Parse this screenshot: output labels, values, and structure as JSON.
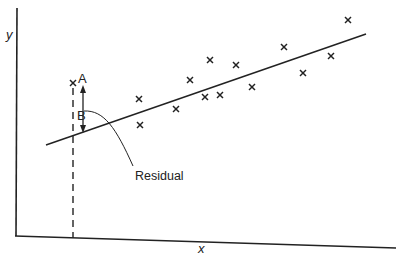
{
  "chart_data": {
    "type": "scatter",
    "title": "",
    "xlabel": "x",
    "ylabel": "y",
    "grid": false,
    "legend": null,
    "points_px": [
      [
        139,
        99
      ],
      [
        140,
        125
      ],
      [
        176,
        109
      ],
      [
        190,
        80
      ],
      [
        205,
        97
      ],
      [
        210,
        60
      ],
      [
        220,
        95
      ],
      [
        236,
        65
      ],
      [
        252,
        87
      ],
      [
        284,
        47
      ],
      [
        303,
        73
      ],
      [
        331,
        56
      ],
      [
        348,
        20
      ]
    ],
    "highlighted_point": {
      "label": "A",
      "px": [
        73,
        83
      ]
    },
    "fitted_point": {
      "label": "B",
      "px": [
        73,
        135
      ]
    },
    "regression_line_px": [
      [
        46,
        145
      ],
      [
        366,
        34
      ]
    ],
    "annotations": [
      {
        "text": "A",
        "meaning": "observed point"
      },
      {
        "text": "B",
        "meaning": "point on regression line"
      },
      {
        "text": "Residual",
        "meaning": "vertical distance A–B"
      }
    ]
  },
  "labels": {
    "y_axis": "y",
    "x_axis": "x",
    "point_a": "A",
    "point_b": "B",
    "residual": "Residual"
  },
  "colors": {
    "ink": "#222222",
    "background": "#ffffff"
  }
}
